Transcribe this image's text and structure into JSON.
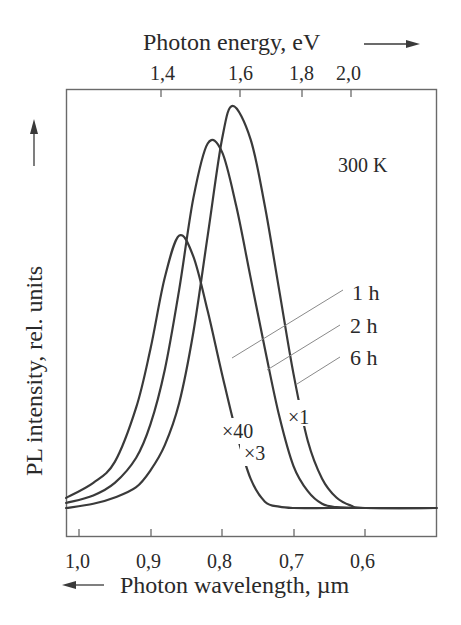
{
  "chart_data": {
    "type": "line",
    "title": "",
    "top_axis": {
      "label": "Photon energy, eV",
      "arrow": "right",
      "ticks": [
        "1,4",
        "1,6",
        "1,8",
        "2,0"
      ],
      "tick_values": [
        1.4,
        1.6,
        1.8,
        2.0
      ]
    },
    "xlabel": "Photon wavelength, µm",
    "x_arrow": "left",
    "xticks": [
      "1,0",
      "0,9",
      "0,8",
      "0,7",
      "0,6"
    ],
    "xtick_values": [
      1.0,
      0.9,
      0.8,
      0.7,
      0.6
    ],
    "xlim": [
      1.018,
      0.5
    ],
    "ylabel": "PL intensity, rel. units",
    "y_arrow": "up",
    "ylim": [
      0,
      100
    ],
    "grid": false,
    "annotation_temperature": "300 K",
    "series": [
      {
        "name": "1 h",
        "scale": "×40",
        "peak_wavelength": 0.86,
        "peak_intensity": 65,
        "x": [
          1.018,
          0.98,
          0.95,
          0.92,
          0.9,
          0.88,
          0.86,
          0.84,
          0.82,
          0.8,
          0.78,
          0.76,
          0.74,
          0.72,
          0.7,
          0.65,
          0.6,
          0.5
        ],
        "y": [
          2.4,
          6,
          11,
          24,
          38,
          55,
          65,
          60,
          47,
          32,
          18,
          7,
          1.5,
          0.3,
          0,
          0,
          0,
          0
        ]
      },
      {
        "name": "2 h",
        "scale": "×3",
        "peak_wavelength": 0.813,
        "peak_intensity": 88,
        "x": [
          1.018,
          0.98,
          0.95,
          0.92,
          0.9,
          0.88,
          0.86,
          0.84,
          0.82,
          0.8,
          0.78,
          0.76,
          0.74,
          0.72,
          0.7,
          0.68,
          0.66,
          0.64,
          0.6,
          0.5
        ],
        "y": [
          1.2,
          3,
          6,
          12,
          20,
          33,
          52,
          74,
          87,
          85,
          72,
          55,
          38,
          22,
          10,
          4,
          1,
          0.2,
          0,
          0
        ]
      },
      {
        "name": "6 h",
        "scale": "×1",
        "peak_wavelength": 0.785,
        "peak_intensity": 96,
        "x": [
          1.018,
          0.98,
          0.95,
          0.92,
          0.9,
          0.88,
          0.86,
          0.84,
          0.82,
          0.8,
          0.785,
          0.76,
          0.74,
          0.72,
          0.7,
          0.68,
          0.66,
          0.64,
          0.62,
          0.6,
          0.5
        ],
        "y": [
          0,
          1,
          2.5,
          5,
          9,
          15,
          25,
          42,
          65,
          88,
          96,
          88,
          72,
          52,
          32,
          16,
          7,
          2.5,
          0.6,
          0,
          0
        ]
      }
    ],
    "legend": [
      {
        "label": "1 h",
        "series": "1 h"
      },
      {
        "label": "2 h",
        "series": "2 h"
      },
      {
        "label": "6 h",
        "series": "6 h"
      }
    ],
    "scale_labels": [
      "×40",
      "×3",
      "×1"
    ]
  },
  "labels": {
    "top_axis_title": "Photon energy, eV",
    "bottom_axis_title": "Photon wavelength, µm",
    "y_axis_title": "PL intensity, rel. units",
    "temperature": "300 K",
    "legend_1h": "1 h",
    "legend_2h": "2 h",
    "legend_6h": "6 h",
    "scale_x40": "×40",
    "scale_x3": "×3",
    "scale_x1": "×1",
    "top_ticks": [
      "1,4",
      "1,6",
      "1,8",
      "2,0"
    ],
    "bottom_ticks": [
      "1,0",
      "0,9",
      "0,8",
      "0,7",
      "0,6"
    ]
  },
  "colors": {
    "line": "#3a3a3a",
    "frame": "#6a6a6a",
    "leader": "#8a8a8a",
    "text": "#2a2a2a"
  }
}
